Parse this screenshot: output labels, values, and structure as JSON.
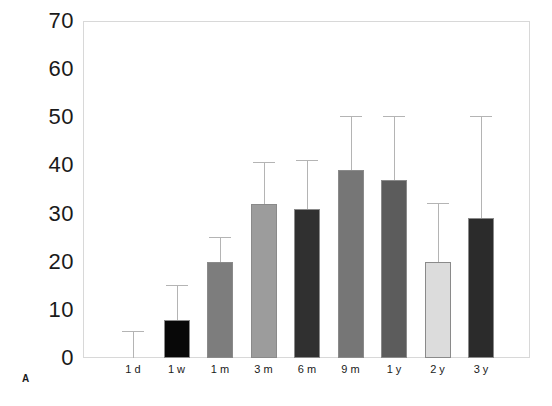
{
  "panel": {
    "letter": "A"
  },
  "chart_data": {
    "type": "bar",
    "title": "",
    "xlabel": "",
    "ylabel": "",
    "ylim": [
      0,
      70
    ],
    "yticks": [
      0,
      10,
      20,
      30,
      40,
      50,
      60,
      70
    ],
    "ytick_labels": [
      "0",
      "10",
      "20",
      "30",
      "40",
      "50",
      "60",
      "70"
    ],
    "grid": false,
    "legend": "none",
    "categories": [
      "1 d",
      "1 w",
      "1 m",
      "3 m",
      "6 m",
      "9 m",
      "1 y",
      "2 y",
      "3 y"
    ],
    "values": [
      0,
      8,
      20,
      32,
      31,
      39,
      37,
      20,
      29
    ],
    "errors_upper": [
      5.5,
      15,
      25,
      40.5,
      41,
      50,
      50,
      32,
      50
    ],
    "bar_colors": [
      "#ffffff",
      "#080808",
      "#7d7d7d",
      "#9c9c9c",
      "#303030",
      "#767676",
      "#5c5c5c",
      "#dcdcdc",
      "#2b2b2b"
    ],
    "series": [
      {
        "name": "value",
        "values": [
          0,
          8,
          20,
          32,
          31,
          39,
          37,
          20,
          29
        ]
      }
    ]
  }
}
